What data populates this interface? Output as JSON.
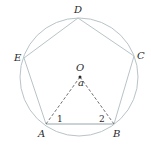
{
  "diagram": {
    "colors": {
      "circle": "#b8c4c8",
      "pentagon": "#b8c4c8",
      "dashed": "#707070",
      "text": "#2a2a2a"
    },
    "circle": {
      "cx": 79,
      "cy": 77,
      "r": 59
    },
    "vertices": [
      {
        "name": "A",
        "x": 46,
        "y": 124,
        "lx": 38,
        "ly": 137
      },
      {
        "name": "B",
        "x": 114,
        "y": 124,
        "lx": 113,
        "ly": 137
      },
      {
        "name": "C",
        "x": 134,
        "y": 56,
        "lx": 137,
        "ly": 59
      },
      {
        "name": "D",
        "x": 78,
        "y": 18,
        "lx": 74,
        "ly": 13
      },
      {
        "name": "E",
        "x": 24,
        "y": 58,
        "lx": 14,
        "ly": 61
      }
    ],
    "center": {
      "name": "O",
      "x": 80,
      "y": 77,
      "lx": 76,
      "ly": 71
    },
    "angle_labels": [
      {
        "text": "a",
        "x": 78,
        "y": 86
      },
      {
        "text": "1",
        "x": 57,
        "y": 122
      },
      {
        "text": "2",
        "x": 99,
        "y": 122
      }
    ]
  }
}
